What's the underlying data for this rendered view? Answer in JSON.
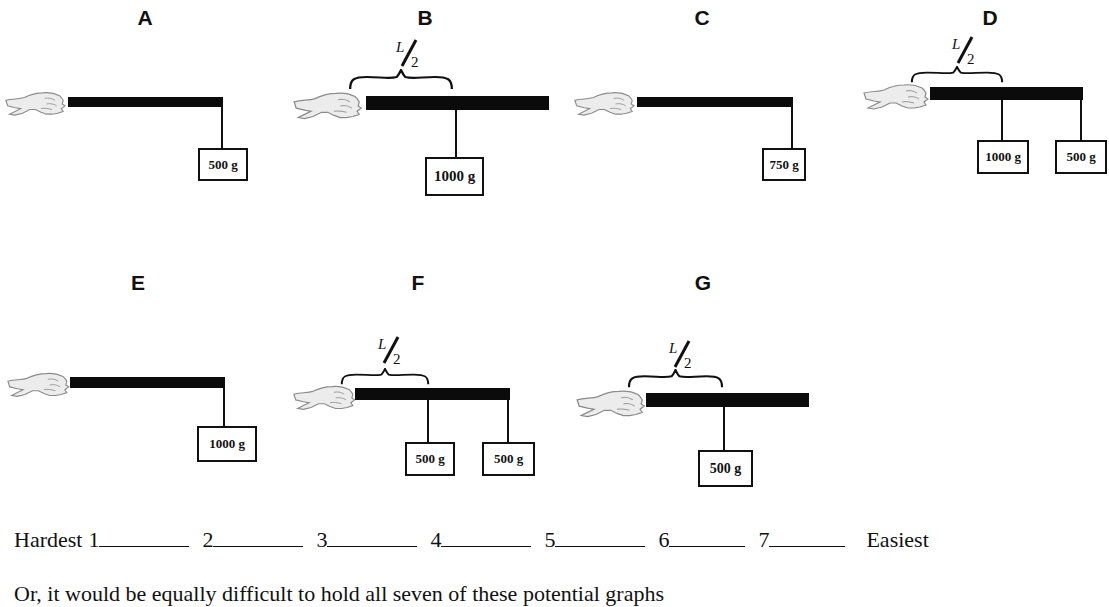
{
  "panels": [
    {
      "label": "A",
      "grip": "end",
      "weights": [
        {
          "mass": "500 g",
          "position": "end"
        }
      ]
    },
    {
      "label": "B",
      "grip": "end",
      "half_length_marker": "L/2",
      "weights": [
        {
          "mass": "1000 g",
          "position": "middle"
        }
      ]
    },
    {
      "label": "C",
      "grip": "end",
      "weights": [
        {
          "mass": "750 g",
          "position": "end"
        }
      ]
    },
    {
      "label": "D",
      "grip": "end",
      "half_length_marker": "L/2",
      "weights": [
        {
          "mass": "1000 g",
          "position": "middle"
        },
        {
          "mass": "500 g",
          "position": "end"
        }
      ]
    },
    {
      "label": "E",
      "grip": "end",
      "weights": [
        {
          "mass": "1000 g",
          "position": "end"
        }
      ]
    },
    {
      "label": "F",
      "grip": "end",
      "half_length_marker": "L/2",
      "weights": [
        {
          "mass": "500 g",
          "position": "middle"
        },
        {
          "mass": "500 g",
          "position": "end"
        }
      ]
    },
    {
      "label": "G",
      "grip": "end",
      "half_length_marker": "L/2",
      "weights": [
        {
          "mass": "500 g",
          "position": "middle"
        }
      ]
    }
  ],
  "half": {
    "numerator": "L",
    "denominator": "2"
  },
  "ranking": {
    "start_label": "Hardest",
    "end_label": "Easiest",
    "slots": [
      "1",
      "2",
      "3",
      "4",
      "5",
      "6",
      "7"
    ]
  },
  "note": "Or, it would be equally difficult to hold all seven of these potential graphs"
}
